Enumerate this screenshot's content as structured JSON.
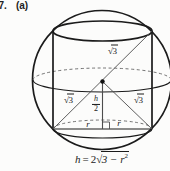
{
  "problem": {
    "number": "57.",
    "part": "(a)"
  },
  "diagram": {
    "sqrt_sign": "√",
    "sqrt_top_radicand": "3",
    "sqrt_left_radicand": "3",
    "sqrt_right_radicand": "3",
    "fraction_numerator": "h",
    "fraction_denominator": "2",
    "radius_left": "r",
    "radius_right": "r"
  },
  "formula": {
    "lhs": "h",
    "equals": "=",
    "coefficient": "2",
    "sqrt_sign": "√",
    "radicand_base": "3 − r",
    "exponent": "2"
  },
  "colors": {
    "line": "#1b1b1b",
    "thin_line": "#4d4d4d",
    "dash_line": "#5a5a5a",
    "background": "#fcfcfb"
  }
}
